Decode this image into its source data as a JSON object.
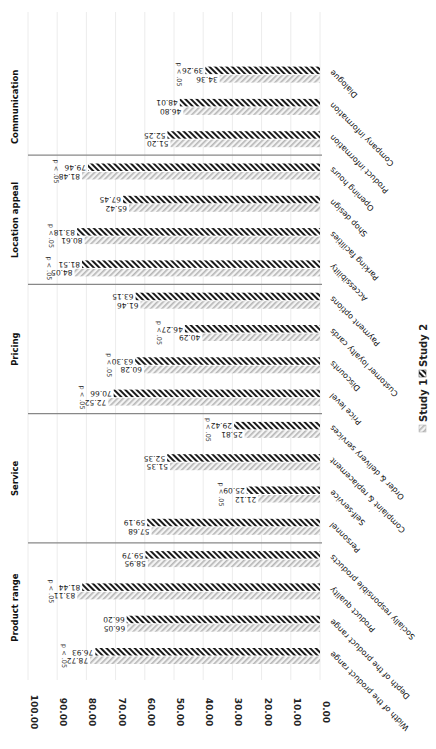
{
  "chart_data": {
    "type": "bar",
    "orientation": "rotated",
    "title": "",
    "xlabel": "",
    "ylabel": "",
    "ylim": [
      0,
      100
    ],
    "yticks": [
      "0.00",
      "10.00",
      "20.00",
      "30.00",
      "40.00",
      "50.00",
      "60.00",
      "70.00",
      "80.00",
      "90.00",
      "100.00"
    ],
    "grid": true,
    "legend": {
      "position": "bottom",
      "entries": [
        {
          "name": "Study 1",
          "pattern": "light-diagonal"
        },
        {
          "name": "Study 2",
          "pattern": "dark-diagonal"
        }
      ]
    },
    "groups": [
      {
        "name": "Product range",
        "categories": [
          "Width of the product range",
          "Depth of the product range",
          "Product quality",
          "Socially responsible products"
        ]
      },
      {
        "name": "Service",
        "categories": [
          "Personnel",
          "Self-service",
          "Complaint & replacement",
          "Order & delivery services"
        ]
      },
      {
        "name": "Pricing",
        "categories": [
          "Price level",
          "Discounts",
          "Customer loyalty cards",
          "Payment options"
        ]
      },
      {
        "name": "Location appeal",
        "categories": [
          "Accessibility",
          "Parking facilities",
          "Shop design",
          "Opening hours"
        ]
      },
      {
        "name": "Communication",
        "categories": [
          "Product information",
          "Company information",
          "Dialogue"
        ]
      }
    ],
    "categories": [
      "Width of the product range",
      "Depth of the product range",
      "Product quality",
      "Socially responsible products",
      "Personnel",
      "Self-service",
      "Complaint & replacement",
      "Order & delivery services",
      "Price level",
      "Discounts",
      "Customer loyalty cards",
      "Payment options",
      "Accessibility",
      "Parking facilities",
      "Shop design",
      "Opening hours",
      "Product information",
      "Company information",
      "Dialogue"
    ],
    "series": [
      {
        "name": "Study 1",
        "values": [
          78.72,
          66.05,
          83.11,
          58.95,
          57.68,
          21.12,
          51.35,
          25.81,
          72.52,
          60.28,
          40.29,
          61.46,
          84.05,
          80.61,
          65.42,
          81.48,
          51.2,
          46.8,
          34.36
        ]
      },
      {
        "name": "Study 2",
        "values": [
          76.93,
          66.2,
          81.44,
          59.79,
          59.19,
          25.09,
          52.35,
          29.42,
          70.66,
          63.3,
          46.27,
          63.15,
          81.51,
          83.18,
          67.45,
          79.46,
          52.25,
          48.01,
          39.26
        ]
      }
    ],
    "value_labels_study1": [
      "78.72",
      "66.05",
      "83.11",
      "58.95",
      "57.68",
      "21.12",
      "51.35",
      "25.81",
      "72.52",
      "60.28",
      "40.29",
      "61.46",
      "84.05",
      "80.61",
      "65.42",
      "81.48",
      "51.20",
      "46.80",
      "34.36"
    ],
    "value_labels_study2": [
      "76.93",
      "66.20",
      "81.44",
      "59.79",
      "59.19",
      "25.09",
      "52.35",
      "29.42",
      "70.66",
      "63.30",
      "46.27",
      "63.15",
      "81.51",
      "83.18",
      "67.45",
      "79.46",
      "52.25",
      "48.01",
      "39.26"
    ],
    "significance": [
      true,
      false,
      true,
      false,
      false,
      true,
      false,
      true,
      true,
      true,
      true,
      false,
      true,
      true,
      false,
      true,
      false,
      false,
      true
    ],
    "significance_label": "p < .05"
  }
}
